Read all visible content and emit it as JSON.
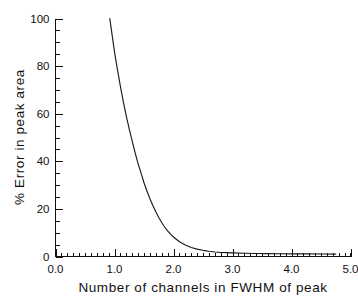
{
  "chart_data": {
    "type": "line",
    "title": "",
    "subtitle": "",
    "xlabel": "Number of channels in FWHM of peak",
    "ylabel": "% Error in peak area",
    "xlim": [
      0.0,
      5.0
    ],
    "ylim": [
      0,
      100
    ],
    "grid": false,
    "legend": null,
    "legend_position": "none",
    "x_major_ticks": [
      "0.0",
      "1.0",
      "2.0",
      "3.0",
      "4.0",
      "5.0"
    ],
    "x_major_values": [
      0.0,
      1.0,
      2.0,
      3.0,
      4.0,
      5.0
    ],
    "x_minor_step": 0.1,
    "y_major_ticks": [
      "0",
      "20",
      "40",
      "60",
      "80",
      "100"
    ],
    "y_major_values": [
      0,
      20,
      40,
      60,
      80,
      100
    ],
    "y_minor_step": 5,
    "tick_direction": "in",
    "series": [
      {
        "name": "% Error in peak area",
        "color": "#1a1a1a",
        "x": [
          0.92,
          0.96,
          1.0,
          1.05,
          1.1,
          1.15,
          1.2,
          1.25,
          1.3,
          1.35,
          1.4,
          1.45,
          1.5,
          1.55,
          1.6,
          1.65,
          1.7,
          1.75,
          1.8,
          1.85,
          1.9,
          1.95,
          2.0,
          2.1,
          2.2,
          2.3,
          2.4,
          2.5,
          2.6,
          2.7,
          2.8,
          2.9,
          3.0,
          3.2,
          3.4,
          3.6,
          3.8,
          4.0,
          4.25,
          4.5,
          4.75
        ],
        "y": [
          100.0,
          93.0,
          86.0,
          78.5,
          71.5,
          65.0,
          59.0,
          53.5,
          48.5,
          43.5,
          39.0,
          35.0,
          31.0,
          27.5,
          24.3,
          21.4,
          18.8,
          16.4,
          14.3,
          12.4,
          10.8,
          9.4,
          8.2,
          6.2,
          4.8,
          3.8,
          3.1,
          2.6,
          2.2,
          1.9,
          1.7,
          1.6,
          1.5,
          1.35,
          1.25,
          1.2,
          1.15,
          1.1,
          1.08,
          1.05,
          1.02
        ]
      }
    ],
    "annotations": []
  },
  "figure": {
    "background_color": "#ffffff",
    "axis_color": "#111111",
    "curve_color": "#1a1a1a"
  }
}
